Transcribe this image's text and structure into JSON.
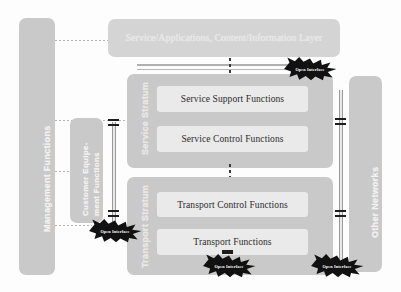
{
  "diagram": {
    "colors": {
      "block_fill": "#c9c9c9",
      "inner_fill": "#eaeaea",
      "burst_fill": "#111111",
      "burst_text": "#ffffff",
      "connector": "#9a9a9a",
      "background": "#fdfdfd"
    }
  },
  "top_banner": {
    "label": "Service/Applications, Content/Information Layer"
  },
  "left_panel": {
    "label": "Management Functions"
  },
  "customer_panel": {
    "label_line1": "Customer Equipe-",
    "label_line2": "ment Functions"
  },
  "right_panel": {
    "label": "Other Networks"
  },
  "strata": [
    {
      "name": "service-stratum",
      "label": "Service Stratum",
      "boxes": [
        {
          "name": "service-support-functions",
          "label": "Service Support Functions"
        },
        {
          "name": "service-control-functions",
          "label": "Service Control Functions"
        }
      ]
    },
    {
      "name": "transport-stratum",
      "label": "Transport Stratum",
      "boxes": [
        {
          "name": "transport-control-functions",
          "label": "Transport Control Functions"
        },
        {
          "name": "transport-functions",
          "label": "Transport Functions"
        }
      ]
    }
  ],
  "open_interfaces": [
    {
      "name": "open-interface-service-top",
      "label": "Open Interface"
    },
    {
      "name": "open-interface-customer-transport",
      "label": "Open Interface"
    },
    {
      "name": "open-interface-transport-bottom",
      "label": "Open Interface"
    },
    {
      "name": "open-interface-other-networks",
      "label": "Open Interface"
    }
  ]
}
